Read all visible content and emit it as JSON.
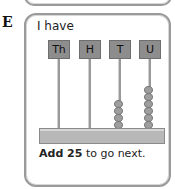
{
  "section_letter": "E",
  "card": {
    "heading": "I have",
    "columns": [
      {
        "label": "Th",
        "beads": 0
      },
      {
        "label": "H",
        "beads": 0
      },
      {
        "label": "T",
        "beads": 4
      },
      {
        "label": "U",
        "beads": 6
      }
    ],
    "instruction": {
      "bold": "Add 25",
      "rest": " to go next."
    }
  },
  "colors": {
    "label_fill": "#8d8d8d",
    "bead": "#9e9e9e",
    "border": "#9a9a9a"
  }
}
